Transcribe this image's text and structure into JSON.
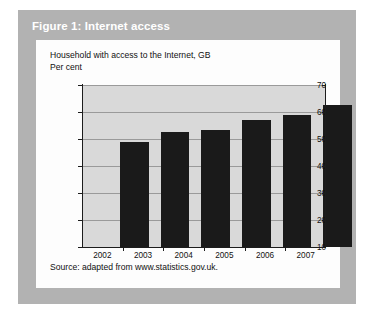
{
  "figure": {
    "header_label": "Figure 1: Internet access",
    "header_bg": "#b2b2b2",
    "header_text_color": "#ffffff",
    "card_bg": "#fdfdfd",
    "source_note": "Source: adapted from www.statistics.gov.uk."
  },
  "chart_data": {
    "type": "bar",
    "title": "Household with access to the Internet, GB",
    "subtitle": "Per cent",
    "xlabel": "",
    "ylabel": "Per cent",
    "categories": [
      "2002",
      "2003",
      "2004",
      "2005",
      "2006",
      "2007"
    ],
    "values": [
      49,
      52.5,
      53.5,
      57,
      59,
      62.5
    ],
    "ylim": [
      10,
      70
    ],
    "ytick_labels": [
      "10",
      "20",
      "30",
      "40",
      "50",
      "60",
      "70"
    ],
    "ytick_values": [
      10,
      20,
      30,
      40,
      50,
      60,
      70
    ],
    "grid": true,
    "legend": "none",
    "bar_color": "#1a1a1a",
    "plot_bg": "#d9d9d9",
    "gridline_color": "#9a9a9a",
    "axis_color": "#1c1c1c"
  }
}
